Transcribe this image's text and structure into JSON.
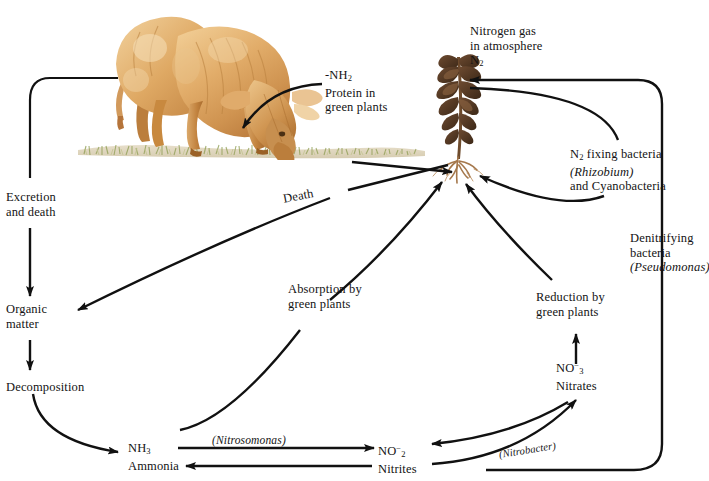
{
  "diagram": {
    "background_color": "#ffffff",
    "line_color": "#111111",
    "text_color": "#131313"
  },
  "illustrations": [
    {
      "name": "grazing-cow",
      "description": "Watercolour illustration of a tan-brown cow grazing on grass",
      "colors": {
        "body_light": "#e8bb7d",
        "body_mid": "#d9a05c",
        "body_dark": "#b97c3c",
        "outline": "#a4682e",
        "highlight": "#f3dcb4"
      }
    },
    {
      "name": "legume-plant",
      "description": "Dark brown leafy plant with root system at the soil line",
      "colors": {
        "leaf_dark": "#4a3323",
        "leaf_mid": "#6b4a30",
        "stem": "#7a5634",
        "root": "#a5784c"
      }
    },
    {
      "name": "grass-ground",
      "description": "Soft green-olive grass strip along the soil line",
      "colors": {
        "grass_light": "#cdcf9a",
        "grass_mid": "#a9ab6d",
        "grass_dark": "#7d8a4a",
        "soil": "#d7cdb0"
      }
    }
  ],
  "labels": {
    "nitrogen_gas": {
      "line1": "Nitrogen gas",
      "line2": "in atmosphere",
      "formula": "N",
      "formula_sub": "2"
    },
    "protein": {
      "formula_pre": "-NH",
      "formula_sub": "2",
      "line1": "Protein in",
      "line2": "green plants"
    },
    "n_fixing": {
      "formula": "N",
      "formula_sub": "2",
      "line1_rest": " fixing bacteria",
      "line2": "(Rhizobium)",
      "line3": "and Cyanobacteria"
    },
    "denitrifying": {
      "line1": "Denitrifying",
      "line2": "bacteria",
      "line3": "(Pseudomonas)"
    },
    "excretion": {
      "line1": "Excretion",
      "line2": "and death"
    },
    "organic_matter": {
      "line1": "Organic",
      "line2": "matter"
    },
    "decomposition": {
      "line1": "Decomposition"
    },
    "death": {
      "text": "Death"
    },
    "absorption": {
      "line1": "Absorption by",
      "line2": "green plants"
    },
    "reduction": {
      "line1": "Reduction by",
      "line2": "green plants"
    },
    "nitrates": {
      "formula": "NO",
      "formula_sup": "−",
      "formula_sub": "3",
      "name": "Nitrates"
    },
    "nitrites": {
      "formula": "NO",
      "formula_sup": "−",
      "formula_sub": "2",
      "name": "Nitrites"
    },
    "ammonia": {
      "formula": "NH",
      "formula_sub": "3",
      "name": "Ammonia"
    },
    "nitrosomonas": {
      "text": "(Nitrosomonas)"
    },
    "nitrobacter": {
      "text": "(Nitrobacter)"
    }
  },
  "flows": [
    {
      "from": "cow",
      "to": "excretion-and-death",
      "label": "Excretion and death"
    },
    {
      "from": "excretion-and-death",
      "to": "organic-matter",
      "label": ""
    },
    {
      "from": "organic-matter",
      "to": "decomposition",
      "label": ""
    },
    {
      "from": "decomposition",
      "to": "ammonia",
      "label": ""
    },
    {
      "from": "plant",
      "to": "organic-matter",
      "label": "Death"
    },
    {
      "from": "protein-in-green-plants",
      "to": "cow",
      "label": ""
    },
    {
      "from": "ammonia",
      "to": "nitrites",
      "label": "(Nitrosomonas)"
    },
    {
      "from": "nitrites",
      "to": "ammonia",
      "label": ""
    },
    {
      "from": "nitrites",
      "to": "nitrates",
      "label": "(Nitrobacter)"
    },
    {
      "from": "nitrates",
      "to": "nitrites",
      "label": "(Nitrobacter)"
    },
    {
      "from": "nitrates",
      "to": "reduction-by-green-plants",
      "label": ""
    },
    {
      "from": "reduction-by-green-plants",
      "to": "plant-roots",
      "label": ""
    },
    {
      "from": "ammonia",
      "to": "plant-roots",
      "label": "Absorption by green plants"
    },
    {
      "from": "nitrogen-gas",
      "to": "n-fixing-bacteria",
      "label": ""
    },
    {
      "from": "n-fixing-bacteria",
      "to": "plant-roots",
      "label": ""
    },
    {
      "from": "nitrites",
      "to": "nitrogen-gas",
      "label": "Denitrifying bacteria (Pseudomonas)"
    }
  ]
}
